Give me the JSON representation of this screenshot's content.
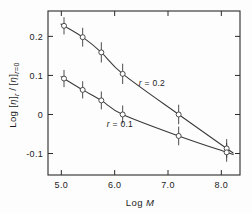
{
  "chart_data": {
    "type": "line",
    "title": "",
    "xlabel": "Log M",
    "ylabel": "Log [η]ᵣ/[η]ᵣ₌₀",
    "xlim": [
      4.75,
      8.35
    ],
    "ylim": [
      -0.155,
      0.265
    ],
    "xticks": [
      5.0,
      6.0,
      7.0,
      8.0
    ],
    "xtick_labels": [
      "5.0",
      "6.0",
      "7.0",
      "8.0"
    ],
    "yticks": [
      0.2,
      0.1,
      0.0,
      -0.1
    ],
    "ytick_labels": [
      "0.2",
      "0.1",
      "0",
      "-0.1"
    ],
    "grid": false,
    "legend_position": "inline-annotation",
    "marker": "open-circle",
    "error_bars": "vertical",
    "series": [
      {
        "name": "r = 0.2",
        "label_x": 6.45,
        "label_y": 0.074,
        "x": [
          5.05,
          5.4,
          5.75,
          6.15,
          7.2,
          8.1
        ],
        "y": [
          0.227,
          0.198,
          0.159,
          0.104,
          0.0,
          -0.087
        ],
        "yerr": [
          0.022,
          0.024,
          0.026,
          0.026,
          0.025,
          0.024
        ]
      },
      {
        "name": "r = 0.1",
        "label_x": 5.85,
        "label_y": -0.032,
        "x": [
          5.05,
          5.4,
          5.75,
          6.15,
          7.2,
          8.1
        ],
        "y": [
          0.092,
          0.063,
          0.036,
          0.0,
          -0.055,
          -0.097
        ],
        "yerr": [
          0.022,
          0.022,
          0.023,
          0.023,
          0.024,
          0.024
        ]
      }
    ],
    "annotations": [
      {
        "text": "r = 0.2",
        "x": 6.45,
        "y": 0.074
      },
      {
        "text": "r = 0.1",
        "x": 5.85,
        "y": -0.032
      }
    ]
  },
  "axes": {
    "x_label_prefix": "Log ",
    "x_label_italic": "M",
    "y_label_text": "Log [η]r /[η]r=0"
  },
  "labels": {
    "series_upper": "r = 0.2",
    "series_lower": "r = 0.1"
  }
}
